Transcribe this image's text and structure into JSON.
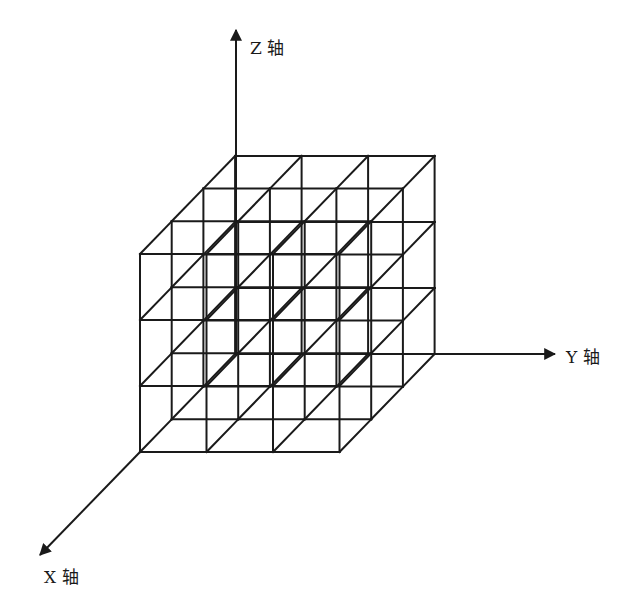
{
  "figure": {
    "type": "3d-cube-lattice",
    "grid": {
      "nx": 3,
      "ny": 3,
      "nz": 3
    },
    "line_color": "#1a1a1a",
    "background": "#ffffff"
  },
  "axes": {
    "z": {
      "label": "Z 轴"
    },
    "y": {
      "label": "Y 轴"
    },
    "x": {
      "label": "X 轴"
    }
  }
}
